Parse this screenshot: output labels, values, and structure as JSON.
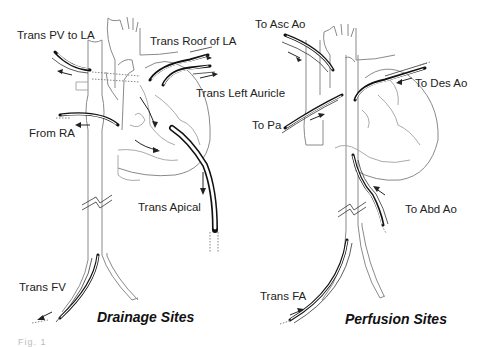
{
  "panels": [
    {
      "title": "Drainage Sites",
      "labels": [
        "Trans PV to LA",
        "Trans Roof of LA",
        "Trans Left Auricle",
        "From RA",
        "Trans Apical",
        "Trans FV"
      ]
    },
    {
      "title": "Perfusion Sites",
      "labels": [
        "To Asc Ao",
        "To Des Ao",
        "To Pa",
        "To Abd Ao",
        "Trans FA"
      ]
    }
  ],
  "caption": "Fig. 1"
}
